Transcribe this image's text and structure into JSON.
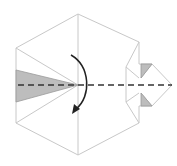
{
  "diagram": {
    "type": "origami-fold-step",
    "colors": {
      "background": "#ffffff",
      "paper_edge": "#c8c8c8",
      "shaded_flap": "#bdbdbd",
      "fold_line": "#333333",
      "arrow": "#222222"
    },
    "elements": {
      "hexagon_outline": "hexagon",
      "center_crease": "vertical-crease",
      "left_flap": "shaded-triangle-left",
      "right_point": "right-arrow-point",
      "upper_small_flap": "shaded-triangle-upper-right",
      "lower_small_flap": "shaded-triangle-lower-right",
      "fold_line": "valley-fold-dashed",
      "fold_arrow": "curved-arrow-down"
    }
  }
}
